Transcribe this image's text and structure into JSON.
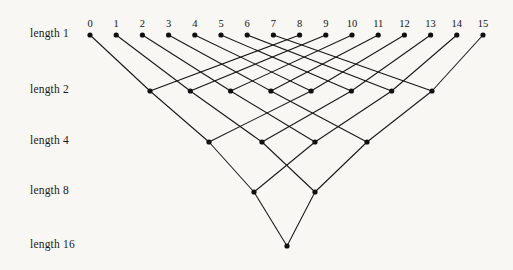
{
  "figure": {
    "background_color": "#f8f7f4",
    "line_color": "#161616",
    "node_color": "#101010",
    "width": 513,
    "height": 270
  },
  "column_labels": [
    "0",
    "1",
    "2",
    "3",
    "4",
    "5",
    "6",
    "7",
    "8",
    "9",
    "10",
    "11",
    "12",
    "13",
    "14",
    "15"
  ],
  "row_labels": [
    {
      "label": "length 1",
      "nodes": 16
    },
    {
      "label": "length 2",
      "nodes": 8
    },
    {
      "label": "length 4",
      "nodes": 4
    },
    {
      "label": "length 8",
      "nodes": 2
    },
    {
      "label": "length 16",
      "nodes": 1
    }
  ],
  "chart_data": {
    "type": "diagram",
    "levels": [
      {
        "name": "length 1",
        "y": 35,
        "x_positions": [
          90,
          116.2,
          142.4,
          168.6,
          194.8,
          221,
          247.2,
          273.4,
          299.6,
          325.8,
          352,
          378.2,
          404.4,
          430.6,
          456.8,
          483
        ]
      },
      {
        "name": "length 2",
        "y": 91,
        "x_positions": [
          150,
          190.3,
          230.6,
          270.9,
          311.1,
          351.4,
          391.7,
          432
        ]
      },
      {
        "name": "length 4",
        "y": 142,
        "x_positions": [
          209,
          262,
          315,
          367
        ]
      },
      {
        "name": "length 8",
        "y": 192,
        "x_positions": [
          254,
          315
        ]
      },
      {
        "name": "length 16",
        "y": 246,
        "x_positions": [
          287
        ]
      }
    ],
    "edges": [
      {
        "from_level": 0,
        "from_index": 0,
        "to_level": 1,
        "to_index": 0
      },
      {
        "from_level": 0,
        "from_index": 1,
        "to_level": 1,
        "to_index": 1
      },
      {
        "from_level": 0,
        "from_index": 2,
        "to_level": 1,
        "to_index": 2
      },
      {
        "from_level": 0,
        "from_index": 3,
        "to_level": 1,
        "to_index": 3
      },
      {
        "from_level": 0,
        "from_index": 4,
        "to_level": 1,
        "to_index": 4
      },
      {
        "from_level": 0,
        "from_index": 5,
        "to_level": 1,
        "to_index": 5
      },
      {
        "from_level": 0,
        "from_index": 6,
        "to_level": 1,
        "to_index": 6
      },
      {
        "from_level": 0,
        "from_index": 7,
        "to_level": 1,
        "to_index": 7
      },
      {
        "from_level": 0,
        "from_index": 8,
        "to_level": 1,
        "to_index": 0
      },
      {
        "from_level": 0,
        "from_index": 9,
        "to_level": 1,
        "to_index": 1
      },
      {
        "from_level": 0,
        "from_index": 10,
        "to_level": 1,
        "to_index": 2
      },
      {
        "from_level": 0,
        "from_index": 11,
        "to_level": 1,
        "to_index": 3
      },
      {
        "from_level": 0,
        "from_index": 12,
        "to_level": 1,
        "to_index": 4
      },
      {
        "from_level": 0,
        "from_index": 13,
        "to_level": 1,
        "to_index": 5
      },
      {
        "from_level": 0,
        "from_index": 14,
        "to_level": 1,
        "to_index": 6
      },
      {
        "from_level": 0,
        "from_index": 15,
        "to_level": 1,
        "to_index": 7
      },
      {
        "from_level": 1,
        "from_index": 0,
        "to_level": 2,
        "to_index": 0
      },
      {
        "from_level": 1,
        "from_index": 1,
        "to_level": 2,
        "to_index": 1
      },
      {
        "from_level": 1,
        "from_index": 2,
        "to_level": 2,
        "to_index": 2
      },
      {
        "from_level": 1,
        "from_index": 3,
        "to_level": 2,
        "to_index": 3
      },
      {
        "from_level": 1,
        "from_index": 4,
        "to_level": 2,
        "to_index": 0
      },
      {
        "from_level": 1,
        "from_index": 5,
        "to_level": 2,
        "to_index": 1
      },
      {
        "from_level": 1,
        "from_index": 6,
        "to_level": 2,
        "to_index": 2
      },
      {
        "from_level": 1,
        "from_index": 7,
        "to_level": 2,
        "to_index": 3
      },
      {
        "from_level": 2,
        "from_index": 0,
        "to_level": 3,
        "to_index": 0
      },
      {
        "from_level": 2,
        "from_index": 1,
        "to_level": 3,
        "to_index": 1
      },
      {
        "from_level": 2,
        "from_index": 2,
        "to_level": 3,
        "to_index": 0
      },
      {
        "from_level": 2,
        "from_index": 3,
        "to_level": 3,
        "to_index": 1
      },
      {
        "from_level": 3,
        "from_index": 0,
        "to_level": 4,
        "to_index": 0
      },
      {
        "from_level": 3,
        "from_index": 1,
        "to_level": 4,
        "to_index": 0
      }
    ],
    "label_x": 30,
    "column_label_y": 18
  }
}
